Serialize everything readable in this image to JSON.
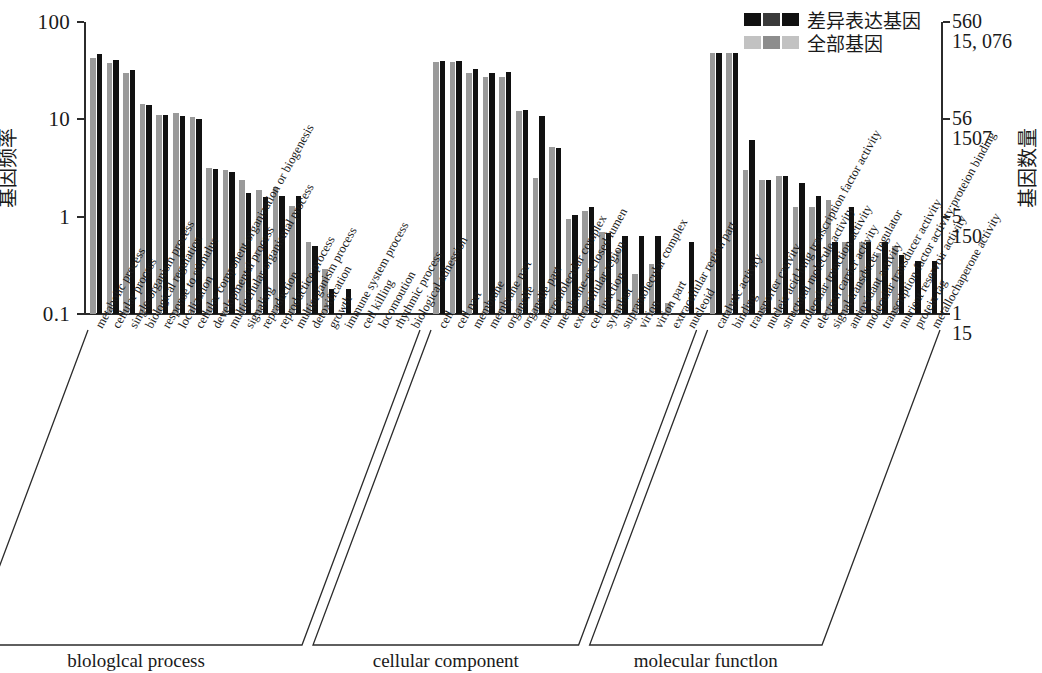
{
  "legend": {
    "items": [
      {
        "label": "差异表达基因",
        "swatch": "black"
      },
      {
        "label": "全部基因",
        "swatch": "gray"
      }
    ]
  },
  "axes": {
    "left_title": "基因频率",
    "right_title": "基因数量",
    "left_ticks": [
      "100",
      "10",
      "1",
      "0.1"
    ],
    "right_ticks": [
      {
        "deg": "560",
        "all": "15, 076"
      },
      {
        "deg": "56",
        "all": "1507"
      },
      {
        "deg": "5",
        "all": "150"
      },
      {
        "deg": "1",
        "all": "15"
      }
    ]
  },
  "groups": [
    {
      "name": "biological process",
      "label": "blologlcal process"
    },
    {
      "name": "cellular component",
      "label": "cellular component"
    },
    {
      "name": "molecular function",
      "label": "molecular functlon"
    }
  ],
  "chart_data": {
    "type": "bar",
    "title": "",
    "xlabel": "",
    "ylabel": "基因频率",
    "y2label": "基因数量",
    "yscale": "log",
    "ylim": [
      0.1,
      100
    ],
    "ytick_values": [
      100,
      10,
      1,
      0.1
    ],
    "grid": false,
    "legend_position": "top-right",
    "series": [
      {
        "name": "全部基因",
        "color": "#9a9a9a"
      },
      {
        "name": "差异表达基因",
        "color": "#111111"
      }
    ],
    "sections": [
      {
        "name": "blologlcal process",
        "categories": [
          "metabolic process",
          "cellular process",
          "single-organism process",
          "biological regulation",
          "response to stimulus",
          "localization",
          "cellular component organization or biogenesis",
          "developmental process",
          "multicellular organismal process",
          "signaling",
          "repraduction",
          "reproductice process",
          "multiorganism process",
          "detoxification",
          "growth",
          "immune system process",
          "cell killing",
          "locomoution",
          "rhythmic process",
          "biological adhession"
        ],
        "all_genes": [
          43,
          38,
          30,
          14.5,
          11,
          11.5,
          10.5,
          3.2,
          3.0,
          2.4,
          1.9,
          2.0,
          1.3,
          0.55,
          0.29,
          0,
          0,
          0,
          0,
          0
        ],
        "deg_genes": [
          47,
          41,
          32,
          14.2,
          11,
          10.8,
          10.0,
          3.1,
          2.9,
          1.75,
          1.6,
          1.65,
          1.65,
          0.5,
          0.18,
          0.18,
          0,
          0,
          0,
          0
        ]
      },
      {
        "name": "cellular component",
        "categories": [
          "cell",
          "cell part",
          "membrane",
          "membrane part",
          "organelle",
          "organelle part",
          "macromolecular complex",
          "membrane-enclosed lumen",
          "extracellular region",
          "cell junction",
          "symplast",
          "supramolecular complex",
          "virion",
          "virion part",
          "extracellular region part",
          "nucleoid"
        ],
        "all_genes": [
          39,
          39,
          30,
          27,
          27,
          12.3,
          2.5,
          5.2,
          0.95,
          1.15,
          0.7,
          0.45,
          0.26,
          0.33,
          0.13,
          0
        ],
        "deg_genes": [
          40,
          40,
          33,
          30,
          31,
          12.6,
          10.8,
          5.1,
          1.05,
          1.25,
          0.68,
          0.64,
          0.64,
          0.64,
          0,
          0.55
        ]
      },
      {
        "name": "molecular functlon",
        "categories": [
          "catalytic activity",
          "binding",
          "transporter cativity",
          "nucleic acid bing transcription factor activity",
          "structural molecule activity",
          "molecular trunction activity",
          "electron carrier activity",
          "signal transducer regulator",
          "antioxidant activity",
          "molecular transducer activity",
          "transcription factor activity;proteion binding",
          "nutrient reservoir activity",
          "protein tag",
          "metallochaperone activity"
        ],
        "all_genes": [
          48,
          48,
          3.0,
          2.4,
          2.6,
          1.25,
          1.25,
          1.5,
          0.55,
          0.55,
          0.42,
          0.5,
          0,
          0
        ],
        "deg_genes": [
          48,
          48,
          6.2,
          2.4,
          2.6,
          2.2,
          1.65,
          0.55,
          1.25,
          0.55,
          0.55,
          0.4,
          0.35,
          0.35
        ]
      }
    ]
  }
}
